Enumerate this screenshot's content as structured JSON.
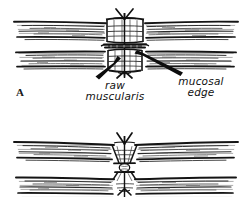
{
  "figure": {
    "kind": "surgical-line-drawing",
    "background_color": "#ffffff",
    "ink_color": "#111111",
    "width": 249,
    "height": 197,
    "panels": [
      {
        "id": "panel-a",
        "label": "A",
        "description": "Upper cross-section: two hatched tissue walls approximated by a vertical suture column with knots above and below"
      },
      {
        "id": "panel-b",
        "label": "",
        "description": "Lower cross-section: narrower tightened closure with a small knot loop at the midline"
      }
    ]
  },
  "annotations": {
    "panel_a_letter": "A",
    "raw_muscularis": {
      "line1": "raw",
      "line2": "muscularis"
    },
    "mucosal_edge": {
      "line1": "mucosal",
      "line2": "edge"
    }
  }
}
